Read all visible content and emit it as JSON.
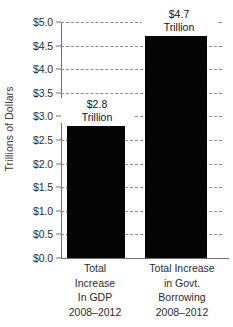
{
  "chart_data": {
    "type": "bar",
    "title": "",
    "xlabel": "",
    "ylabel": "Trillions of Dollars",
    "ylim": [
      0.0,
      5.0
    ],
    "ytick_step": 0.5,
    "grid": true,
    "legend": "none",
    "bar_color": "#050505",
    "gridline_color": "#8c8c8c",
    "axis_color": "#6e6e6e",
    "categories": [
      "Total Increase In GDP 2008–2012",
      "Total Increase in Govt. Borrowing 2008–2012"
    ],
    "values": [
      2.8,
      4.7
    ],
    "value_labels": [
      "$2.8 Trillion",
      "$4.7 Trillion"
    ],
    "ytick_labels": [
      "$0.0",
      "$0.5",
      "$1.0",
      "$1.5",
      "$2.0",
      "$2.5",
      "$3.0",
      "$3.5",
      "$4.0",
      "$4.5",
      "$5.0"
    ],
    "ytick_values": [
      0.0,
      0.5,
      1.0,
      1.5,
      2.0,
      2.5,
      3.0,
      3.5,
      4.0,
      4.5,
      5.0
    ],
    "bars": [
      {
        "name": "total-increase-in-gdp",
        "value": 2.8,
        "amount_text": "$2.8",
        "unit_text": "Trillion",
        "label_lines": [
          "Total",
          "Increase",
          "In GDP",
          "2008–2012"
        ]
      },
      {
        "name": "total-increase-in-govt-borrowing",
        "value": 4.7,
        "amount_text": "$4.7",
        "unit_text": "Trillion",
        "label_lines": [
          "Total Increase",
          "in Govt.",
          "Borrowing",
          "2008–2012"
        ]
      }
    ]
  }
}
